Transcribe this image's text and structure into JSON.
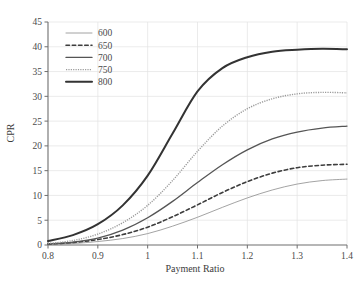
{
  "chart_data": {
    "type": "line",
    "title": "",
    "xlabel": "Payment Ratio",
    "ylabel": "CPR",
    "xlim": [
      0.8,
      1.4
    ],
    "ylim": [
      0,
      45
    ],
    "xticks": [
      0.8,
      0.9,
      1,
      1.1,
      1.2,
      1.3,
      1.4
    ],
    "xtick_labels": [
      "0.8",
      "0.9",
      "1",
      "1.1",
      "1.2",
      "1.3",
      "1.4"
    ],
    "yticks": [
      0,
      5,
      10,
      15,
      20,
      25,
      30,
      35,
      40,
      45
    ],
    "ytick_labels": [
      "0",
      "5",
      "10",
      "15",
      "20",
      "25",
      "30",
      "35",
      "40",
      "45"
    ],
    "grid": true,
    "legend_position": "upper-left",
    "x": [
      0.8,
      0.85,
      0.9,
      0.95,
      1.0,
      1.05,
      1.1,
      1.15,
      1.2,
      1.25,
      1.3,
      1.35,
      1.4
    ],
    "series": [
      {
        "name": "600",
        "label": "600",
        "style": "solid",
        "width": 0.8,
        "color": "#8c8c8c",
        "values": [
          0.1,
          0.3,
          0.7,
          1.3,
          2.3,
          3.8,
          5.6,
          7.6,
          9.5,
          11.1,
          12.3,
          13.0,
          13.3
        ]
      },
      {
        "name": "650",
        "label": "650",
        "style": "dashed",
        "width": 1.6,
        "color": "#3d3d3d",
        "values": [
          0.2,
          0.5,
          1.1,
          2.1,
          3.6,
          5.7,
          8.1,
          10.6,
          12.8,
          14.5,
          15.6,
          16.1,
          16.3
        ]
      },
      {
        "name": "700",
        "label": "700",
        "style": "solid",
        "width": 1.3,
        "color": "#555555",
        "values": [
          0.2,
          0.6,
          1.4,
          3.0,
          5.5,
          8.8,
          12.6,
          16.2,
          19.2,
          21.4,
          22.8,
          23.6,
          24.0
        ]
      },
      {
        "name": "750",
        "label": "750",
        "style": "dotted",
        "width": 1.4,
        "color": "#9a9a9a",
        "values": [
          0.3,
          0.9,
          2.2,
          4.5,
          8.0,
          13.0,
          18.9,
          24.0,
          27.5,
          29.5,
          30.5,
          30.8,
          30.7
        ]
      },
      {
        "name": "800",
        "label": "800",
        "style": "solid",
        "width": 2.0,
        "color": "#333333",
        "values": [
          0.8,
          2.0,
          4.2,
          8.0,
          14.0,
          22.5,
          31.0,
          35.7,
          37.9,
          39.0,
          39.4,
          39.6,
          39.5
        ]
      }
    ]
  }
}
